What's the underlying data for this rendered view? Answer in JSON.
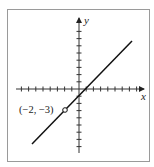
{
  "chart_data": {
    "type": "line",
    "title": "",
    "xlabel": "x",
    "ylabel": "y",
    "equation": "y = x - 1",
    "series": [
      {
        "name": "line",
        "x": [
          -6,
          7
        ],
        "y": [
          -7,
          6
        ]
      }
    ],
    "annotations": [
      {
        "text": "(−2, −3)",
        "x": -2,
        "y": -3,
        "marker": "open-circle"
      }
    ],
    "xlim": [
      -8,
      8
    ],
    "ylim": [
      -8,
      10
    ],
    "tick_spacing": 1,
    "grid": false,
    "legend": "none"
  },
  "labels": {
    "x_axis": "x",
    "y_axis": "y",
    "point": "(−2, −3)"
  }
}
